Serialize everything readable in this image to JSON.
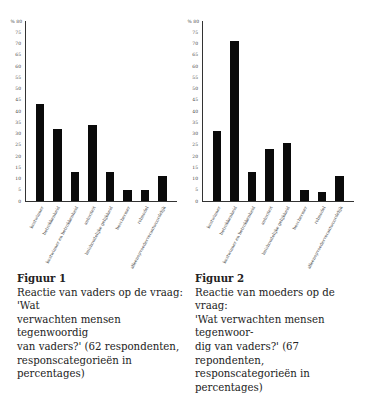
{
  "chart_data": [
    {
      "type": "bar",
      "title": "Figuur 1",
      "caption": "Reactie van vaders op de vraag: 'Wat verwachten mensen tegenwoordig van vaders?' (62 respondenten, responscategorieën in percentages)",
      "categories": [
        "kostwinner",
        "betrokkenheid",
        "kostwinner en betrokkenheid",
        "autoriteit",
        "huishoudelijke gelijkheid",
        "beschermer",
        "rolmodel",
        "alleenopvoederverantwoordelijk"
      ],
      "values": [
        43,
        32,
        13,
        34,
        13,
        5,
        5,
        11
      ],
      "xlabel": "",
      "ylabel": "%",
      "ylim": [
        0,
        80
      ],
      "yticks": [
        0,
        5,
        10,
        15,
        20,
        25,
        30,
        35,
        40,
        45,
        50,
        55,
        60,
        65,
        70,
        75,
        80
      ],
      "grid": false,
      "legend": null
    },
    {
      "type": "bar",
      "title": "Figuur 2",
      "caption": "Reactie van moeders op de vraag: 'Wat verwachten mensen tegenwoordig van vaders?' (67 repondenten, responscategorieën in percentages)",
      "categories": [
        "kostwinner",
        "betrokkenheid",
        "kostwinner en betrokkenheid",
        "autoriteit",
        "huishoudelijke gelijkheid",
        "beschermer",
        "rolmodel",
        "alleenopvoederverantwoordelijk"
      ],
      "values": [
        31,
        71,
        13,
        23,
        26,
        5,
        4,
        11
      ],
      "xlabel": "",
      "ylabel": "%",
      "ylim": [
        0,
        80
      ],
      "yticks": [
        0,
        5,
        10,
        15,
        20,
        25,
        30,
        35,
        40,
        45,
        50,
        55,
        60,
        65,
        70,
        75,
        80
      ],
      "grid": false,
      "legend": null
    }
  ],
  "figures": [
    {
      "unit_label": "%",
      "title": "Figuur 1",
      "caption_lines": [
        "Reactie van vaders op de vraag: 'Wat",
        "verwachten mensen tegenwoordig",
        "van vaders?' (62 respondenten,",
        "responscategorieën in percentages)"
      ]
    },
    {
      "unit_label": "%",
      "title": "Figuur 2",
      "caption_lines": [
        "Reactie van moeders op de vraag:",
        "'Wat verwachten mensen tegenwoor-",
        "dig van vaders?' (67 repondenten,",
        "responscategorieën in percentages)"
      ]
    }
  ],
  "colors": {
    "bar": "#0a0a0a",
    "axis": "#333333",
    "text": "#222222"
  }
}
